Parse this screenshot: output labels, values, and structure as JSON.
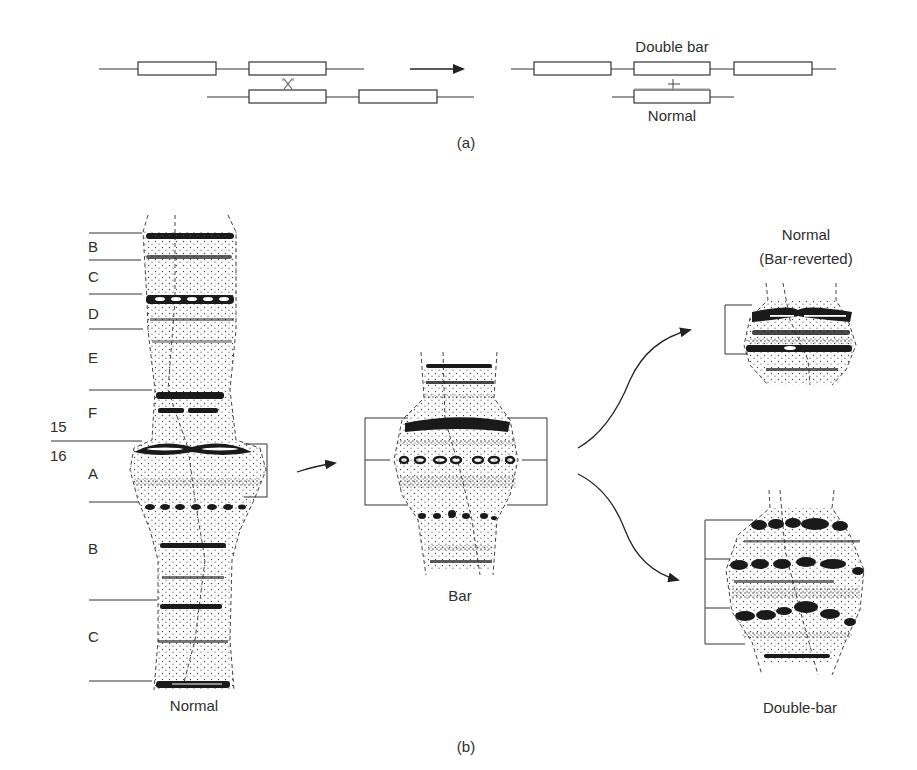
{
  "figure": {
    "panel_a": {
      "label": "(a)",
      "labels": {
        "top_right": "Double bar",
        "bottom_right": "Normal"
      },
      "crossover_symbol": "X",
      "plus_symbol": "+",
      "description": "Unequal crossing over between misaligned duplicated segments yields a double-bar chromosome and a normal chromosome"
    },
    "panel_b": {
      "label": "(b)",
      "normal": {
        "caption": "Normal",
        "region_labels": [
          "B",
          "C",
          "D",
          "E",
          "F",
          "A",
          "B",
          "C"
        ],
        "division_labels": [
          "15",
          "16"
        ]
      },
      "bar": {
        "caption": "Bar"
      },
      "reverted": {
        "caption_line1": "Normal",
        "caption_line2": "(Bar-reverted)"
      },
      "double_bar": {
        "caption": "Double-bar"
      }
    }
  },
  "colors": {
    "ink": "#2a2a2a",
    "background": "#ffffff"
  }
}
